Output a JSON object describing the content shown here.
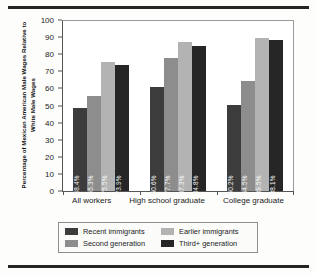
{
  "chart_data": {
    "type": "bar",
    "title": "",
    "subtitle": "",
    "xlabel": "",
    "ylabel": "Percentage of Mexican American Male Wages Relative to White Male Wages",
    "ylim": [
      0,
      100
    ],
    "yticks": [
      0,
      10,
      20,
      30,
      40,
      50,
      60,
      70,
      80,
      90,
      100
    ],
    "ytick_labels": [
      "0",
      "10",
      "20",
      "30",
      "40",
      "50",
      "60",
      "70",
      "80",
      "90",
      "100"
    ],
    "grid": false,
    "legend_position": "bottom",
    "categories": [
      "All workers",
      "High school graduate",
      "College graduate"
    ],
    "series": [
      {
        "name": "Recent immigrants",
        "color": "#3c3c3c",
        "values": [
          48.4,
          60.6,
          50.2
        ],
        "labels": [
          "48.4%",
          "60.6%",
          "50.2%"
        ]
      },
      {
        "name": "Second generation",
        "color": "#8d8d8d",
        "values": [
          55.3,
          77.7,
          64.5
        ],
        "labels": [
          "55.3%",
          "77.7%",
          "64.5%"
        ]
      },
      {
        "name": "Earlier immigrants",
        "color": "#b3b3b3",
        "values": [
          75.5,
          87.3,
          89.5
        ],
        "labels": [
          "75.5%",
          "87.3%",
          "89.5%"
        ]
      },
      {
        "name": "Third+ generation",
        "color": "#262626",
        "values": [
          73.9,
          84.8,
          88.1
        ],
        "labels": [
          "73.9%",
          "84.8%",
          "88.1%"
        ]
      }
    ],
    "legend_order": [
      "Recent immigrants",
      "Earlier immigrants",
      "Second generation",
      "Third+ generation"
    ]
  },
  "legend": {
    "items": [
      {
        "label": "Recent immigrants",
        "color": "#3c3c3c"
      },
      {
        "label": "Earlier immigrants",
        "color": "#b3b3b3"
      },
      {
        "label": "Second generation",
        "color": "#8d8d8d"
      },
      {
        "label": "Third+ generation",
        "color": "#262626"
      }
    ]
  }
}
